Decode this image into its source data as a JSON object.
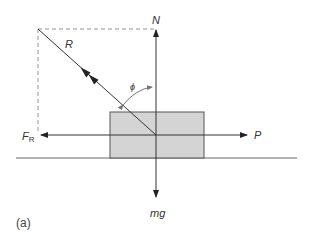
{
  "figure": {
    "caption": "(a)",
    "labels": {
      "normal_force": "N",
      "resultant": "R",
      "angle": "ϕ",
      "friction_main": "F",
      "friction_sub": "R",
      "push_force": "P",
      "weight": "mg"
    },
    "colors": {
      "line": "#333333",
      "dashed": "#888888",
      "block_fill": "#d4d4d4",
      "block_stroke": "#555555",
      "ground": "#666666",
      "angle_arc": "#777777"
    }
  }
}
